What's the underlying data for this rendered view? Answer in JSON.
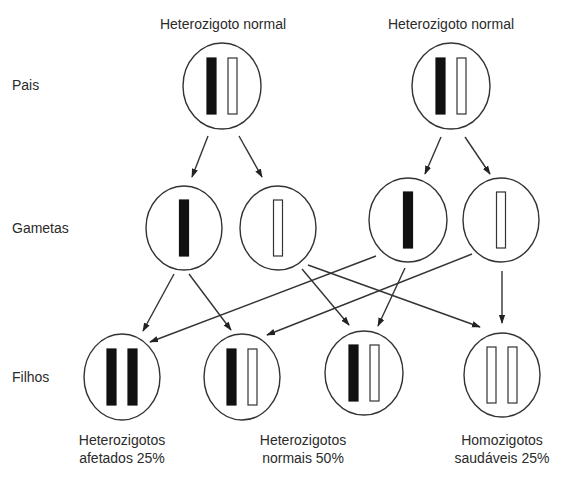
{
  "colors": {
    "line": "#333333",
    "filled_chromosome": "#111111",
    "empty_chromosome": "#ffffff",
    "background": "#ffffff"
  },
  "row_labels": {
    "parents": "Pais",
    "gametes": "Gametas",
    "children": "Filhos"
  },
  "parents": [
    {
      "title": "Heterozigoto normal",
      "cx": 222,
      "cy": 86,
      "rx": 39,
      "ry": 43,
      "chromosomes": [
        "filled",
        "empty"
      ]
    },
    {
      "title": "Heterozigoto normal",
      "cx": 451,
      "cy": 86,
      "rx": 39,
      "ry": 43,
      "chromosomes": [
        "filled",
        "empty"
      ]
    }
  ],
  "gametes": [
    {
      "cx": 184,
      "cy": 228,
      "rx": 38,
      "ry": 42,
      "chromosomes": [
        "filled"
      ]
    },
    {
      "cx": 278,
      "cy": 228,
      "rx": 38,
      "ry": 42,
      "chromosomes": [
        "empty"
      ]
    },
    {
      "cx": 408,
      "cy": 220,
      "rx": 39,
      "ry": 42,
      "chromosomes": [
        "filled"
      ]
    },
    {
      "cx": 501,
      "cy": 220,
      "rx": 38,
      "ry": 42,
      "chromosomes": [
        "empty"
      ]
    }
  ],
  "children": [
    {
      "cx": 122,
      "cy": 377,
      "rx": 38,
      "ry": 43,
      "chromosomes": [
        "filled",
        "filled"
      ]
    },
    {
      "cx": 242,
      "cy": 377,
      "rx": 38,
      "ry": 43,
      "chromosomes": [
        "filled",
        "empty"
      ]
    },
    {
      "cx": 364,
      "cy": 373,
      "rx": 39,
      "ry": 42,
      "chromosomes": [
        "filled",
        "empty"
      ]
    },
    {
      "cx": 502,
      "cy": 375,
      "rx": 38,
      "ry": 42,
      "chromosomes": [
        "empty",
        "empty"
      ]
    }
  ],
  "captions": [
    {
      "line1": "Heterozigotos",
      "line2": "afetados 25%",
      "cx": 122
    },
    {
      "line1": "Heterozigotos",
      "line2": "normais 50%",
      "cx": 303
    },
    {
      "line1": "Homozigotos",
      "line2": "saudáveis 25%",
      "cx": 502
    }
  ],
  "arrows": [
    {
      "from": [
        208,
        136
      ],
      "to": [
        192,
        177
      ]
    },
    {
      "from": [
        239,
        136
      ],
      "to": [
        262,
        177
      ]
    },
    {
      "from": [
        441,
        137
      ],
      "to": [
        425,
        174
      ]
    },
    {
      "from": [
        465,
        137
      ],
      "to": [
        490,
        174
      ]
    },
    {
      "from": [
        174,
        274
      ],
      "to": [
        143,
        331
      ]
    },
    {
      "from": [
        189,
        274
      ],
      "to": [
        231,
        330
      ]
    },
    {
      "from": [
        376,
        256
      ],
      "to": [
        150,
        342
      ]
    },
    {
      "from": [
        472,
        254
      ],
      "to": [
        267,
        335
      ]
    },
    {
      "from": [
        302,
        269
      ],
      "to": [
        349,
        325
      ]
    },
    {
      "from": [
        308,
        265
      ],
      "to": [
        480,
        327
      ]
    },
    {
      "from": [
        405,
        268
      ],
      "to": [
        378,
        326
      ]
    },
    {
      "from": [
        502,
        271
      ],
      "to": [
        502,
        323
      ]
    }
  ]
}
